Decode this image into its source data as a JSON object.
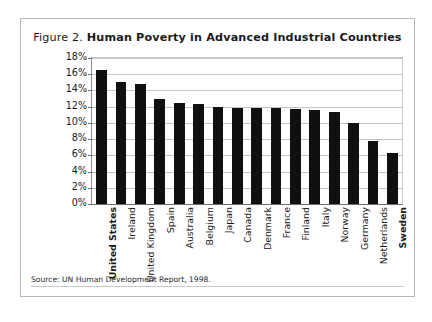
{
  "figure": {
    "number_label": "Figure 2.",
    "title": "Human Poverty in Advanced Industrial Countries",
    "source_note": "Source: UN Human Development Report, 1998."
  },
  "chart_data": {
    "type": "bar",
    "title": "Human Poverty in Advanced Industrial Countries",
    "xlabel": "",
    "ylabel": "Level of Poverty",
    "ylim": [
      0,
      18
    ],
    "ytick_labels": [
      "18%",
      "16%",
      "14%",
      "12%",
      "10%",
      "8%",
      "6%",
      "4%",
      "2%",
      "0%"
    ],
    "ytick_values": [
      18,
      16,
      14,
      12,
      10,
      8,
      6,
      4,
      2,
      0
    ],
    "grid": true,
    "legend": "none",
    "bar_color": "#101010",
    "categories": [
      "United States",
      "Ireland",
      "United Kingdom",
      "Spain",
      "Australia",
      "Belgium",
      "Japan",
      "Canada",
      "Denmark",
      "France",
      "Finland",
      "Italy",
      "Norway",
      "Germany",
      "Netherlands",
      "Sweden"
    ],
    "emphasized_categories": [
      "United States",
      "Sweden"
    ],
    "values": [
      16.5,
      15.1,
      14.8,
      13.0,
      12.4,
      12.3,
      12.0,
      11.8,
      11.8,
      11.8,
      11.7,
      11.6,
      11.3,
      10.0,
      7.8,
      6.3
    ],
    "value_unit": "%"
  }
}
